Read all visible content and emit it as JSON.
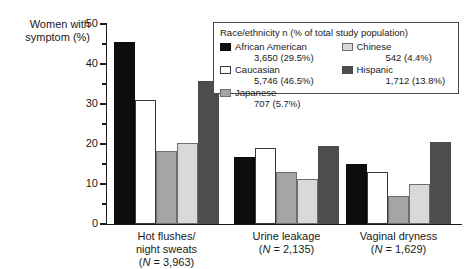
{
  "chart_data": {
    "type": "bar",
    "title": "",
    "ylabel": "Women with symptom (%)",
    "xlabel": "",
    "ylim": [
      0,
      50
    ],
    "yticks": [
      0,
      10,
      20,
      30,
      40,
      50
    ],
    "ytick_labels": [
      "0",
      "10",
      "20",
      "30",
      "40",
      "50"
    ],
    "minor_tick_step": 5,
    "grid": false,
    "legend_position": "top-right",
    "legend_title": "Race/ethnicity n (% of total study population)",
    "categories": [
      "Hot flushes/ night sweats (N = 3,963)",
      "Urine leakage (N = 2,135)",
      "Vaginal dryness (N = 1,629)"
    ],
    "series": [
      {
        "name": "African American",
        "count": "3,650",
        "percent": "(29.5%)",
        "color": "#0d0d0d",
        "values": [
          45.5,
          16.8,
          15.0
        ]
      },
      {
        "name": "Caucasian",
        "count": "5,746",
        "percent": "(46.5%)",
        "color": "#ffffff",
        "values": [
          31.0,
          19.0,
          13.0
        ]
      },
      {
        "name": "Japanese",
        "count": "707",
        "percent": "(5.7%)",
        "color": "#a5a5a5",
        "values": [
          18.3,
          13.0,
          7.0
        ]
      },
      {
        "name": "Chinese",
        "count": "542",
        "percent": "(4.4%)",
        "color": "#d9d9d9",
        "values": [
          20.3,
          11.3,
          10.0
        ]
      },
      {
        "name": "Hispanic",
        "count": "1,712",
        "percent": "(13.8%)",
        "color": "#4d4d4d",
        "values": [
          35.8,
          19.5,
          20.5
        ]
      }
    ]
  },
  "axis": {
    "ylabel_line1": "Women with",
    "ylabel_line2": "symptom (%)",
    "ytick_0": "0",
    "ytick_10": "10",
    "ytick_20": "20",
    "ytick_30": "30",
    "ytick_40": "40",
    "ytick_50": "50"
  },
  "xlabels": [
    {
      "line1": "Hot flushes/",
      "line2": "night sweats",
      "n_prefix": "(",
      "n_italic": "N",
      "n_suffix": " = 3,963)"
    },
    {
      "line1": "Urine leakage",
      "line2": "",
      "n_prefix": "(",
      "n_italic": "N",
      "n_suffix": " = 2,135)"
    },
    {
      "line1": "Vaginal dryness",
      "line2": "",
      "n_prefix": "(",
      "n_italic": "N",
      "n_suffix": " = 1,629)"
    }
  ],
  "legend": {
    "title": "Race/ethnicity n (% of total study population)",
    "left_column": [
      {
        "label": "African American",
        "detail": "3,650 (29.5%)"
      },
      {
        "label": "Caucasian",
        "detail": "5,746 (46.5%)"
      },
      {
        "label": "Japanese",
        "detail": "707 (5.7%)"
      }
    ],
    "right_column": [
      {
        "label": "Chinese",
        "detail": "542 (4.4%)"
      },
      {
        "label": "Hispanic",
        "detail": "1,712 (13.8%)"
      }
    ]
  }
}
